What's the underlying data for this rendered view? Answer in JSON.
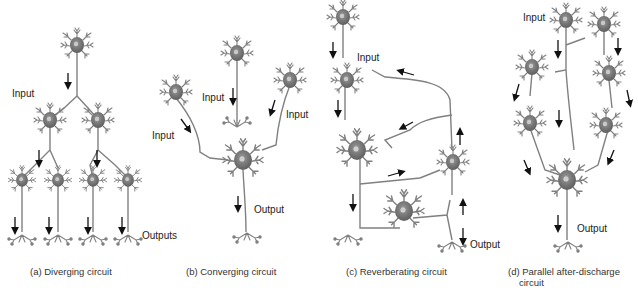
{
  "panels": [
    {
      "id": "a",
      "caption": "(a) Diverging circuit",
      "labels": {
        "input": "Input",
        "output": "Outputs"
      }
    },
    {
      "id": "b",
      "caption": "(b) Converging circuit",
      "labels": {
        "input_left": "Input",
        "input_middle": "Input",
        "input_right": "Input",
        "output": "Output"
      }
    },
    {
      "id": "c",
      "caption": "(c) Reverberating circuit",
      "labels": {
        "input": "Input",
        "output": "Output"
      }
    },
    {
      "id": "d",
      "caption_line1": "(d) Parallel after-discharge",
      "caption_line2": "circuit",
      "labels": {
        "input": "Input",
        "output": "Output"
      }
    }
  ],
  "colors": {
    "neuron": "#7a7a7a",
    "soma": "#6e6e6e",
    "nucleus": "#b5b5b5",
    "arrow": "#111111",
    "text": "#222222"
  }
}
